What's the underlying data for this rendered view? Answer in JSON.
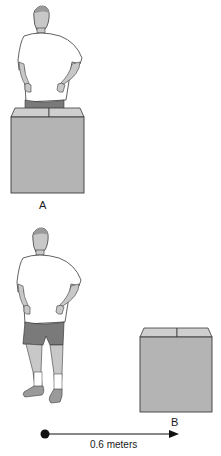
{
  "scene_a": {
    "label": "A"
  },
  "scene_b": {
    "label": "B"
  },
  "displacement": {
    "label": "0.6 meters"
  },
  "colors": {
    "skin": "#c8c8c8",
    "shirt": "#ffffff",
    "shorts": "#7a7a7a",
    "shoe": "#9a9a9a",
    "box_face": "#b4b4b4",
    "box_flap": "#cfcfcf",
    "outline": "#3a3a3a",
    "arrow": "#111111"
  }
}
